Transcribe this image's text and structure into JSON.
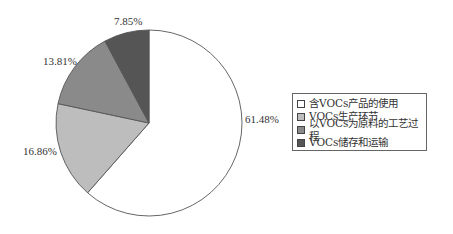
{
  "chart_data": {
    "type": "pie",
    "title": "",
    "categories": [
      "含VOCs产品的使用",
      "VOCs生产环节",
      "以VOCs为原料的工艺过程",
      "VOCs储存和运输"
    ],
    "values": [
      61.48,
      16.86,
      13.81,
      7.85
    ],
    "value_labels": [
      "61.48%",
      "16.86%",
      "13.81%",
      "7.85%"
    ],
    "colors": [
      "#ffffff",
      "#bdbdbd",
      "#8a8a8a",
      "#555555"
    ],
    "start_angle": "12 o'clock",
    "direction": "clockwise",
    "legend_position": "right"
  },
  "labels": {
    "l0": "61.48%",
    "l1": "16.86%",
    "l2": "13.81%",
    "l3": "7.85%"
  },
  "legend": {
    "items": [
      {
        "label": "含VOCs产品的使用",
        "color": "#ffffff"
      },
      {
        "label": "VOCs生产环节",
        "color": "#bdbdbd"
      },
      {
        "label": "以VOCs为原料的工艺过程",
        "color": "#8a8a8a"
      },
      {
        "label": "VOCs储存和运输",
        "color": "#555555"
      }
    ]
  }
}
